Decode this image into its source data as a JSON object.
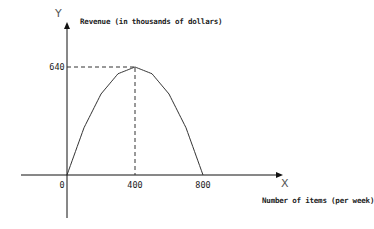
{
  "chart_data": {
    "type": "line",
    "title": "",
    "ylabel": "Revenue (in thousands of dollars)",
    "xlabel": "Number of items (per week)",
    "x_axis_letter": "X",
    "y_axis_letter": "Y",
    "x": [
      0,
      100,
      200,
      300,
      400,
      500,
      600,
      700,
      800
    ],
    "series": [
      {
        "name": "Revenue",
        "values": [
          0,
          280,
          480,
          600,
          640,
          600,
          480,
          280,
          0
        ]
      }
    ],
    "x_ticks": [
      "0",
      "400",
      "800"
    ],
    "y_ticks": [
      "640"
    ],
    "annotations": [
      {
        "type": "dashed-guide",
        "from": [
          0,
          640
        ],
        "to": [
          400,
          640
        ]
      },
      {
        "type": "dashed-guide",
        "from": [
          400,
          0
        ],
        "to": [
          400,
          640
        ]
      }
    ],
    "xlim": [
      0,
      800
    ],
    "ylim": [
      0,
      640
    ],
    "grid": false,
    "legend": null
  },
  "colors": {
    "curve": "#333333",
    "axis": "#111111",
    "guide": "#333333"
  }
}
